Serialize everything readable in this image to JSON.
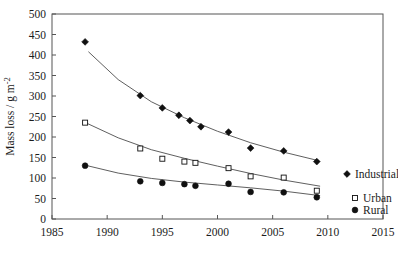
{
  "chart_data": {
    "type": "scatter",
    "title": "",
    "xlabel": "",
    "ylabel": "Mass loss / g m⁻²",
    "xlim": [
      1985,
      2015
    ],
    "ylim": [
      0,
      500
    ],
    "xticks": [
      1985,
      1990,
      1995,
      2000,
      2005,
      2010,
      2015
    ],
    "xticklabels": [
      "1985",
      "1990",
      "1995",
      "2000",
      "2005",
      "2010",
      "2015"
    ],
    "yticks": [
      0,
      50,
      100,
      150,
      200,
      250,
      300,
      350,
      400,
      450,
      500
    ],
    "yticklabels": [
      "0",
      "50",
      "100",
      "150",
      "200",
      "250",
      "300",
      "350",
      "400",
      "450",
      "500"
    ],
    "grid": false,
    "legend_position": "right-inside",
    "series": [
      {
        "name": "Industrial",
        "marker": "filled-diamond",
        "x": [
          1988,
          1993,
          1995,
          1996.5,
          1997.5,
          1998.5,
          2001,
          2003,
          2006,
          2009
        ],
        "y": [
          432,
          301,
          271,
          253,
          240,
          225,
          212,
          173,
          166,
          140
        ]
      },
      {
        "name": "Urban",
        "marker": "open-square",
        "x": [
          1988,
          1993,
          1995,
          1997,
          1998,
          2001,
          2003,
          2006,
          2009
        ],
        "y": [
          235,
          172,
          147,
          140,
          137,
          124,
          104,
          101,
          69
        ]
      },
      {
        "name": "Rural",
        "marker": "filled-circle",
        "x": [
          1988,
          1993,
          1995,
          1997,
          1998,
          2001,
          2003,
          2006,
          2009
        ],
        "y": [
          130,
          92,
          88,
          85,
          81,
          86,
          66,
          65,
          53
        ]
      }
    ],
    "trend_lines": [
      {
        "name": "Industrial",
        "points": [
          [
            1988.3,
            408
          ],
          [
            1991,
            340
          ],
          [
            1994,
            286
          ],
          [
            1997,
            247
          ],
          [
            2000,
            214
          ],
          [
            2003,
            186
          ],
          [
            2006,
            163
          ],
          [
            2009.2,
            142
          ]
        ]
      },
      {
        "name": "Urban",
        "points": [
          [
            1988.2,
            233
          ],
          [
            1991,
            198
          ],
          [
            1994,
            169
          ],
          [
            1997,
            148
          ],
          [
            2000,
            129
          ],
          [
            2003,
            111
          ],
          [
            2006,
            95
          ],
          [
            2009.3,
            80
          ]
        ]
      },
      {
        "name": "Rural",
        "points": [
          [
            1988.2,
            130
          ],
          [
            1991,
            112
          ],
          [
            1994,
            99
          ],
          [
            1997,
            90
          ],
          [
            2000,
            83
          ],
          [
            2003,
            76
          ],
          [
            2006,
            68
          ],
          [
            2009.3,
            57
          ]
        ]
      }
    ],
    "legend": [
      {
        "label": "Industrial",
        "marker": "filled-diamond"
      },
      {
        "label": "Urban",
        "marker": "open-square"
      },
      {
        "label": "Rural",
        "marker": "filled-circle"
      }
    ],
    "colors": {
      "axis": "#555555",
      "marker": "#101010",
      "line": "#4d4d4d",
      "background": "#ffffff"
    }
  }
}
